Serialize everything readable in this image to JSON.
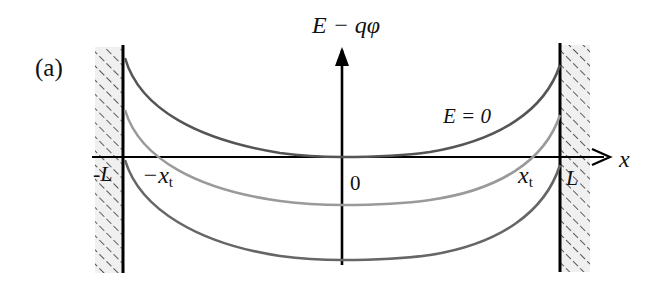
{
  "panel_label": "(a)",
  "axes": {
    "y_label": "E − qφ",
    "x_label": "x",
    "origin_label": "0"
  },
  "tick_labels": {
    "left_wall": "-L",
    "right_wall": "L",
    "neg_turning_point": "−x",
    "neg_turning_point_sub": "t",
    "pos_turning_point": "x",
    "pos_turning_point_sub": "t"
  },
  "curve_labels": {
    "top_curve": "E = 0"
  },
  "colors": {
    "axis": "#000000",
    "wall": "#000000",
    "curve_top": "#555555",
    "curve_middle": "#9a9a9a",
    "curve_bottom": "#666666",
    "hatch": "#333333",
    "hatch_bg": "#f0f0f0"
  },
  "curves": [
    {
      "name": "E = 0",
      "left_y": 58,
      "min_y": 157,
      "right_y": 65
    },
    {
      "name": "intermediate",
      "left_y": 110,
      "min_y": 205,
      "right_y": 115
    },
    {
      "name": "lowest",
      "left_y": 160,
      "min_y": 260,
      "right_y": 165
    }
  ]
}
